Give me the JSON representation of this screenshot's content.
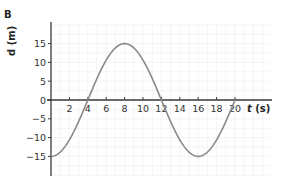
{
  "panel_label": "B",
  "chart_data": {
    "type": "line",
    "title": "",
    "panel": "B",
    "xlabel": "t (s)",
    "ylabel": "d (m)",
    "xlim": [
      0,
      22
    ],
    "ylim": [
      -20,
      20
    ],
    "x_ticks": [
      2,
      4,
      6,
      8,
      10,
      12,
      14,
      16,
      18,
      20
    ],
    "y_ticks": [
      15,
      10,
      5,
      0,
      -5,
      -10,
      -15
    ],
    "grid": true,
    "legend": null,
    "series": [
      {
        "name": "d(t)",
        "color": "#8a8a8a",
        "x": [
          0,
          2,
          4,
          6,
          8,
          10,
          12,
          14,
          16,
          18,
          20
        ],
        "y": [
          -15,
          -10.6,
          0,
          10.6,
          15,
          10.6,
          0,
          -10.6,
          -15,
          -10.6,
          0
        ]
      }
    ]
  },
  "colors": {
    "axis": "#3a3a3a",
    "curve": "#8a8a8a",
    "grid": "#ececec"
  }
}
